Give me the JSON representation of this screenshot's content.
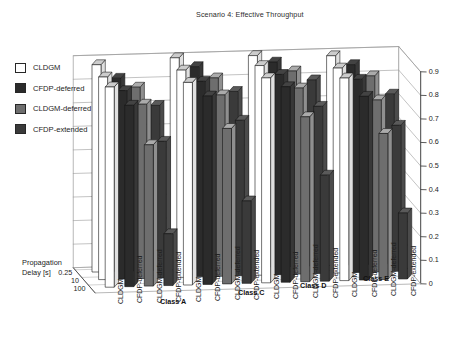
{
  "title": "Scenario 4: Effective Throughput",
  "legend": {
    "items": [
      {
        "label": "CLDGM",
        "color": "#ffffff"
      },
      {
        "label": "CFDP-deferred",
        "color": "#2b2b2b"
      },
      {
        "label": "CLDGM-deferred",
        "color": "#6e6e6e"
      },
      {
        "label": "CFDP-extended",
        "color": "#3a3a3a"
      }
    ]
  },
  "axes": {
    "value_axis": {
      "position": "right",
      "ticks": [
        "0.9",
        "0.8",
        "0.7",
        "0.6",
        "0.5",
        "0.4",
        "0.3",
        "0.2",
        "0.1",
        "0"
      ],
      "min": 0,
      "max": 0.9
    },
    "depth_axis": {
      "title_line1": "Propagation",
      "title_line2": "Delay [s]",
      "ticks": [
        "0.25",
        "10",
        "100"
      ]
    },
    "category_axis": {
      "protocols": [
        "CLDGM",
        "CFDP-deferred",
        "CLDGM-deferred",
        "CFDP-extended"
      ],
      "groups": [
        "Class A",
        "Class C",
        "Class D",
        "Class E"
      ]
    }
  },
  "chart_data": {
    "type": "bar",
    "title": "Scenario 4: Effective Throughput",
    "xlabel": "",
    "ylabel": "",
    "zlabel": "Propagation Delay [s]",
    "ylim": [
      0,
      0.9
    ],
    "grid": true,
    "legend_position": "upper-left",
    "categories": [
      "Class A / CLDGM",
      "Class A / CFDP-deferred",
      "Class A / CLDGM-deferred",
      "Class A / CFDP-extended",
      "Class C / CLDGM",
      "Class C / CFDP-deferred",
      "Class C / CLDGM-deferred",
      "Class C / CFDP-extended",
      "Class D / CLDGM",
      "Class D / CFDP-deferred",
      "Class D / CLDGM-deferred",
      "Class D / CFDP-extended",
      "Class E / CLDGM",
      "Class E / CFDP-deferred",
      "Class E / CLDGM-deferred",
      "Class E / CFDP-extended"
    ],
    "depth_categories": [
      "0.25",
      "10",
      "100"
    ],
    "series": [
      {
        "name": "0.25",
        "values": [
          0.88,
          0.82,
          0.78,
          0.7,
          0.9,
          0.86,
          0.81,
          0.75,
          0.9,
          0.87,
          0.83,
          0.79,
          0.89,
          0.85,
          0.8,
          0.72
        ]
      },
      {
        "name": "10",
        "values": [
          0.86,
          0.8,
          0.74,
          0.58,
          0.88,
          0.83,
          0.77,
          0.66,
          0.89,
          0.85,
          0.79,
          0.71,
          0.87,
          0.82,
          0.73,
          0.62
        ]
      },
      {
        "name": "100",
        "values": [
          0.85,
          0.77,
          0.6,
          0.22,
          0.86,
          0.8,
          0.66,
          0.35,
          0.87,
          0.83,
          0.7,
          0.45,
          0.86,
          0.78,
          0.62,
          0.28
        ]
      }
    ]
  }
}
